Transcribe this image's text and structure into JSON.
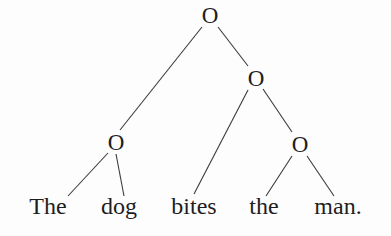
{
  "diagram": {
    "type": "binary-constituency-tree",
    "node_symbol": "O",
    "nodes": [
      {
        "id": "root",
        "label": "O",
        "x": 210,
        "y": 15
      },
      {
        "id": "vp",
        "label": "O",
        "x": 256,
        "y": 78
      },
      {
        "id": "np_subj",
        "label": "O",
        "x": 116,
        "y": 142
      },
      {
        "id": "np_obj",
        "label": "O",
        "x": 300,
        "y": 144
      }
    ],
    "words": [
      {
        "id": "w1",
        "text": "The",
        "x": 48,
        "y": 214
      },
      {
        "id": "w2",
        "text": "dog",
        "x": 119,
        "y": 214
      },
      {
        "id": "w3",
        "text": "bites",
        "x": 194,
        "y": 214
      },
      {
        "id": "w4",
        "text": "the",
        "x": 264,
        "y": 214
      },
      {
        "id": "w5",
        "text": "man.",
        "x": 338,
        "y": 214
      }
    ],
    "edges": [
      {
        "from": "root",
        "to": "np_subj",
        "x1": 202,
        "y1": 27,
        "x2": 120,
        "y2": 130
      },
      {
        "from": "root",
        "to": "vp",
        "x1": 218,
        "y1": 27,
        "x2": 248,
        "y2": 66
      },
      {
        "from": "np_subj",
        "to": "w1",
        "x1": 108,
        "y1": 153,
        "x2": 68,
        "y2": 196
      },
      {
        "from": "np_subj",
        "to": "w2",
        "x1": 116,
        "y1": 154,
        "x2": 124,
        "y2": 196
      },
      {
        "from": "vp",
        "to": "w3",
        "x1": 248,
        "y1": 90,
        "x2": 194,
        "y2": 194
      },
      {
        "from": "vp",
        "to": "np_obj",
        "x1": 263,
        "y1": 89,
        "x2": 292,
        "y2": 132
      },
      {
        "from": "np_obj",
        "to": "w4",
        "x1": 292,
        "y1": 156,
        "x2": 266,
        "y2": 196
      },
      {
        "from": "np_obj",
        "to": "w5",
        "x1": 307,
        "y1": 156,
        "x2": 334,
        "y2": 196
      }
    ],
    "sentence": "The dog bites the man."
  }
}
